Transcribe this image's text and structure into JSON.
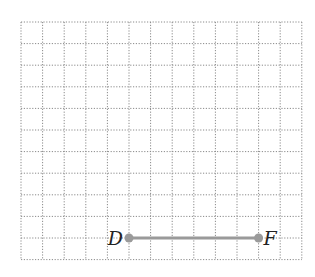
{
  "grid": {
    "columns": 13,
    "rows": 11,
    "left": 21,
    "top": 22,
    "cell": 21.6,
    "line_color": "#8a8a8a",
    "line_style": "dotted"
  },
  "segment": {
    "color": "#9a9a9a",
    "from": "D",
    "to": "F"
  },
  "points": [
    {
      "label": "D",
      "col": 5,
      "row": 10,
      "label_side": "left"
    },
    {
      "label": "F",
      "col": 11,
      "row": 10,
      "label_side": "right"
    }
  ]
}
